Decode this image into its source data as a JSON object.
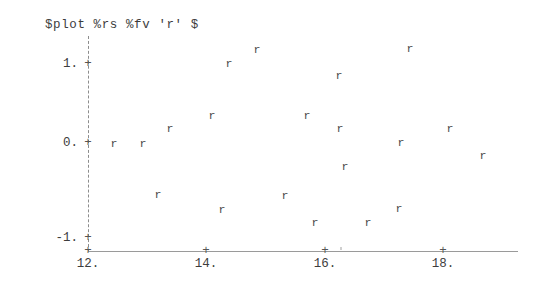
{
  "terminal": {
    "command_echo": "$plot %rs %fv 'r' $",
    "prompt_symbol": "$",
    "command_name": "plot",
    "arg_1": "%rs",
    "arg_2": "%fv",
    "arg_3": "'r'"
  },
  "axes": {
    "y_ticks": [
      {
        "label": "1.",
        "value": 1,
        "tick_glyph": "+"
      },
      {
        "label": "0.",
        "value": 0,
        "tick_glyph": "+"
      },
      {
        "label": "-1.",
        "value": -1,
        "tick_glyph": "+"
      }
    ],
    "x_ticks": [
      {
        "label": "12.",
        "value": 12,
        "tick_glyph": "+"
      },
      {
        "label": "14.",
        "value": 14,
        "tick_glyph": "+"
      },
      {
        "label": "16.",
        "value": 16,
        "tick_glyph": "+"
      },
      {
        "label": "18.",
        "value": 18,
        "tick_glyph": "+"
      }
    ],
    "y_axis_style": "dashed",
    "x_axis_style": "solid",
    "axis_color": "#9a9a9a"
  },
  "chart_data": {
    "type": "scatter",
    "title": "$plot %rs %fv 'r' $",
    "xlabel": "",
    "ylabel": "",
    "xlim": [
      11.6,
      19.3
    ],
    "ylim": [
      -1.27,
      1.37
    ],
    "grid": false,
    "legend": null,
    "marker_glyph": "r",
    "marker_color": "#4a4a4a",
    "series": [
      {
        "name": "r",
        "points": [
          {
            "x": 12.44,
            "y": 0.0
          },
          {
            "x": 12.93,
            "y": 0.0
          },
          {
            "x": 13.19,
            "y": 0.17
          },
          {
            "x": 13.39,
            "y": -0.59
          },
          {
            "x": 13.58,
            "y": 0.33
          },
          {
            "x": 14.27,
            "y": -0.77
          },
          {
            "x": 14.39,
            "y": 0.93
          },
          {
            "x": 14.86,
            "y": 1.11
          },
          {
            "x": 15.37,
            "y": 0.33
          },
          {
            "x": 15.34,
            "y": -0.6
          },
          {
            "x": 15.85,
            "y": -0.92
          },
          {
            "x": 16.26,
            "y": 0.8
          },
          {
            "x": 16.27,
            "y": 0.17
          },
          {
            "x": 16.18,
            "y": -0.26
          },
          {
            "x": 16.75,
            "y": -0.92
          },
          {
            "x": 17.28,
            "y": -0.75
          },
          {
            "x": 17.3,
            "y": -0.07
          },
          {
            "x": 17.46,
            "y": 1.11
          },
          {
            "x": 18.13,
            "y": 0.17
          },
          {
            "x": 18.69,
            "y": -0.14
          }
        ]
      }
    ]
  },
  "markers_px": [
    {
      "left": 114,
      "top": 143
    },
    {
      "left": 143,
      "top": 143
    },
    {
      "left": 158,
      "top": 194
    },
    {
      "left": 170,
      "top": 128
    },
    {
      "left": 212,
      "top": 115
    },
    {
      "left": 222,
      "top": 209
    },
    {
      "left": 229,
      "top": 63
    },
    {
      "left": 257,
      "top": 49
    },
    {
      "left": 285,
      "top": 195
    },
    {
      "left": 307,
      "top": 115
    },
    {
      "left": 315,
      "top": 222
    },
    {
      "left": 339,
      "top": 75
    },
    {
      "left": 340,
      "top": 128
    },
    {
      "left": 345,
      "top": 166
    },
    {
      "left": 368,
      "top": 222
    },
    {
      "left": 399,
      "top": 208
    },
    {
      "left": 401,
      "top": 142
    },
    {
      "left": 410,
      "top": 48
    },
    {
      "left": 450,
      "top": 128
    },
    {
      "left": 483,
      "top": 155
    }
  ],
  "tick_px": {
    "y": [
      {
        "top": 64,
        "label_left": 78,
        "tick_left": 88
      },
      {
        "top": 143,
        "label_left": 78,
        "tick_left": 88
      },
      {
        "top": 238,
        "label_left": 78,
        "tick_left": 88
      }
    ],
    "x": [
      {
        "left": 88,
        "label_top": 258
      },
      {
        "left": 206,
        "label_top": 258
      },
      {
        "left": 325,
        "label_top": 258
      },
      {
        "left": 443,
        "label_top": 258
      }
    ]
  }
}
